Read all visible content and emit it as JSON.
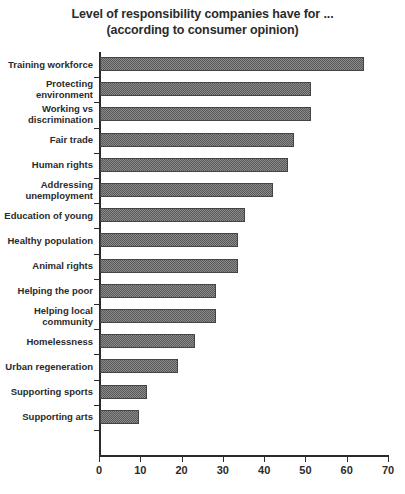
{
  "chart_data": {
    "type": "bar",
    "orientation": "horizontal",
    "title": "Level of responsibility companies have for ...",
    "subtitle": "(according to consumer opinion)",
    "title_lines": [
      "Level of responsibility companies have for ...",
      "(according to consumer opinion)"
    ],
    "xlabel": "",
    "ylabel": "",
    "xlim": [
      0,
      70
    ],
    "xticks": [
      0,
      10,
      20,
      30,
      40,
      50,
      60,
      70
    ],
    "xtick_labels": [
      "0",
      "10",
      "20",
      "30",
      "40",
      "50",
      "60",
      "70"
    ],
    "grid": false,
    "legend": null,
    "bar_fill": "#8a8a8a",
    "bar_pattern": "checkerboard-hatch",
    "bar_border": "#444444",
    "categories": [
      "Training workforce",
      "Protecting environment",
      "Working vs discrimination",
      "Fair trade",
      "Human rights",
      "Addressing unemployment",
      "Education of young",
      "Healthy population",
      "Animal rights",
      "Helping the poor",
      "Helping local community",
      "Homelessness",
      "Urban regeneration",
      "Supporting sports",
      "Supporting arts"
    ],
    "category_label_lines": [
      [
        "Training workforce"
      ],
      [
        "Protecting",
        "environment"
      ],
      [
        "Working vs",
        "discrimination"
      ],
      [
        "Fair trade"
      ],
      [
        "Human rights"
      ],
      [
        "Addressing",
        "unemployment"
      ],
      [
        "Education of young"
      ],
      [
        "Healthy population"
      ],
      [
        "Animal rights"
      ],
      [
        "Helping the poor"
      ],
      [
        "Helping local",
        "community"
      ],
      [
        "Homelessness"
      ],
      [
        "Urban regeneration"
      ],
      [
        "Supporting sports"
      ],
      [
        "Supporting arts"
      ]
    ],
    "values": [
      64,
      51,
      51,
      47,
      45.5,
      42,
      35,
      33.5,
      33.5,
      28,
      28,
      23,
      19,
      11.5,
      9.5
    ]
  }
}
